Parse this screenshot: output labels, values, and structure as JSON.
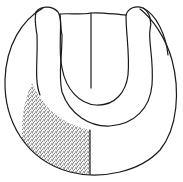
{
  "figure": {
    "type": "scientific line drawing",
    "colors": {
      "background": "#ffffff",
      "line": "#1a1a1a",
      "stipple": "#333333"
    },
    "parts": [
      {
        "name": "outer-body",
        "label": ""
      },
      {
        "name": "u-band",
        "label": ""
      },
      {
        "name": "inner-cavity",
        "label": ""
      },
      {
        "name": "central-line",
        "label": ""
      },
      {
        "name": "stippled-region",
        "label": ""
      }
    ]
  }
}
